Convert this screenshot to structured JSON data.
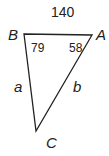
{
  "diagram": {
    "type": "triangle",
    "vertices": {
      "A": {
        "label": "A",
        "angle": "58"
      },
      "B": {
        "label": "B",
        "angle": "79"
      },
      "C": {
        "label": "C"
      }
    },
    "sides": {
      "AB": {
        "label": "140"
      },
      "BC": {
        "label": "a"
      },
      "AC": {
        "label": "b"
      }
    },
    "stroke_color": "#222222"
  }
}
